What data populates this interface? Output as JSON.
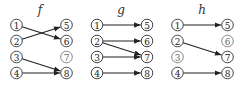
{
  "diagrams": [
    {
      "title": "f",
      "left_nodes": [
        "1",
        "2",
        "3",
        "4"
      ],
      "right_nodes": [
        "5",
        "6",
        "7",
        "8"
      ],
      "edges": [
        [
          "1",
          "6"
        ],
        [
          "2",
          "5"
        ],
        [
          "3",
          "8"
        ],
        [
          "4",
          "8"
        ]
      ],
      "isolated": [
        "7"
      ]
    },
    {
      "title": "g",
      "left_nodes": [
        "1",
        "2",
        "3",
        "4"
      ],
      "right_nodes": [
        "5",
        "6",
        "7",
        "8"
      ],
      "edges": [
        [
          "1",
          "5"
        ],
        [
          "2",
          "6"
        ],
        [
          "2",
          "7"
        ],
        [
          "3",
          "7"
        ],
        [
          "4",
          "8"
        ]
      ],
      "isolated": []
    },
    {
      "title": "h",
      "left_nodes": [
        "1",
        "2",
        "3",
        "4"
      ],
      "right_nodes": [
        "5",
        "6",
        "7",
        "8"
      ],
      "edges": [
        [
          "1",
          "5"
        ],
        [
          "2",
          "7"
        ],
        [
          "4",
          "8"
        ]
      ],
      "isolated": [
        "3",
        "6"
      ]
    }
  ]
}
